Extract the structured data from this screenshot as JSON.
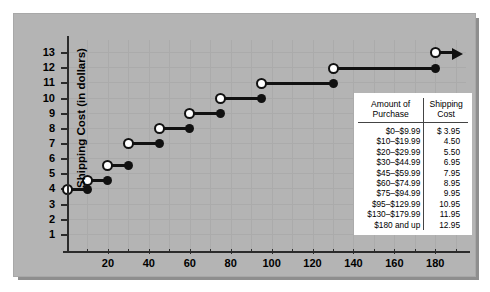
{
  "chart_data": {
    "type": "line",
    "subtype": "step-function",
    "title": "",
    "xlabel": "Purchase Price (in dollars)",
    "ylabel": "Shipping Cost (in dollars)",
    "xlim": [
      0,
      195
    ],
    "ylim": [
      0,
      13.8
    ],
    "xticks": [
      20,
      40,
      60,
      80,
      100,
      120,
      140,
      160,
      180
    ],
    "yticks": [
      1,
      2,
      3,
      4,
      5,
      6,
      7,
      8,
      9,
      10,
      11,
      12,
      13
    ],
    "grid": true,
    "legend": null,
    "series": [
      {
        "name": "Shipping Cost",
        "steps": [
          {
            "x_start": 0,
            "x_end": 10,
            "y": 3.95,
            "left_endpoint": "closed-filled-shown-open",
            "right_endpoint": "closed"
          },
          {
            "x_start": 10,
            "x_end": 20,
            "y": 4.5,
            "left_endpoint": "open",
            "right_endpoint": "closed"
          },
          {
            "x_start": 20,
            "x_end": 30,
            "y": 5.5,
            "left_endpoint": "open",
            "right_endpoint": "closed"
          },
          {
            "x_start": 30,
            "x_end": 45,
            "y": 6.95,
            "left_endpoint": "open",
            "right_endpoint": "closed"
          },
          {
            "x_start": 45,
            "x_end": 60,
            "y": 7.95,
            "left_endpoint": "open",
            "right_endpoint": "closed"
          },
          {
            "x_start": 60,
            "x_end": 75,
            "y": 8.95,
            "left_endpoint": "open",
            "right_endpoint": "closed"
          },
          {
            "x_start": 75,
            "x_end": 95,
            "y": 9.95,
            "left_endpoint": "open",
            "right_endpoint": "closed"
          },
          {
            "x_start": 95,
            "x_end": 130,
            "y": 10.95,
            "left_endpoint": "open",
            "right_endpoint": "closed"
          },
          {
            "x_start": 130,
            "x_end": 180,
            "y": 11.95,
            "left_endpoint": "open",
            "right_endpoint": "closed"
          },
          {
            "x_start": 180,
            "x_end": 195,
            "y": 12.95,
            "left_endpoint": "open",
            "right_endpoint": "arrow"
          }
        ]
      }
    ]
  },
  "table": {
    "headers": [
      "Amount of Purchase",
      "Shipping Cost"
    ],
    "header_lines": [
      [
        "Amount of",
        "Purchase"
      ],
      [
        "Shipping",
        "Cost"
      ]
    ],
    "rows": [
      {
        "amount": "$0–$9.99",
        "cost": "$ 3.95"
      },
      {
        "amount": "$10–$19.99",
        "cost": "4.50"
      },
      {
        "amount": "$20–$29.99",
        "cost": "5.50"
      },
      {
        "amount": "$30–$44.99",
        "cost": "6.95"
      },
      {
        "amount": "$45–$59.99",
        "cost": "7.95"
      },
      {
        "amount": "$60–$74.99",
        "cost": "8.95"
      },
      {
        "amount": "$75–$94.99",
        "cost": "9.95"
      },
      {
        "amount": "$95–$129.99",
        "cost": "10.95"
      },
      {
        "amount": "$130–$179.99",
        "cost": "11.95"
      },
      {
        "amount": "$180 and up",
        "cost": "12.95"
      }
    ]
  },
  "colors": {
    "panel_bg": "#b4b4b4",
    "shadow": "#8e8e8e",
    "axis": "#2b2b2b",
    "grid": "#ababab",
    "marker_fill": "#111111",
    "marker_open": "#ffffff",
    "table_bg": "#ffffff",
    "text": "#000000"
  }
}
